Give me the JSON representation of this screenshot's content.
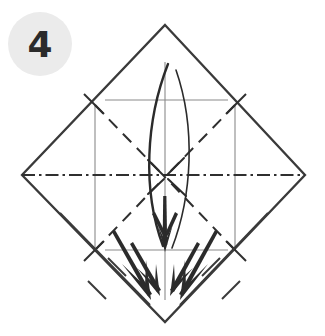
{
  "figure": {
    "kind": "origami-fold-instruction",
    "title": "",
    "step_number": "4",
    "background_color": "#ffffff"
  },
  "step_badge": {
    "label": "4",
    "circle_fill": "#ebebeb",
    "text_color": "#2b2b2b",
    "center_x": 40,
    "center_y": 44,
    "radius": 32
  },
  "colors": {
    "outline": "#3a3a3a",
    "crease_light": "#8a8a8a",
    "crease_dark": "#2f2f2f",
    "arrow": "#2b2b2b",
    "badge_fill": "#ebebeb"
  },
  "geometry": {
    "top_vertex": [
      165,
      25
    ],
    "right_vertex": [
      305,
      175
    ],
    "bottom_vertex": [
      165,
      322
    ],
    "left_vertex": [
      22,
      175
    ],
    "center": [
      165,
      177
    ]
  },
  "legend": {
    "outline_label": "paper edge",
    "valley_label": "valley fold (dashed)",
    "axis_label": "axis of symmetry (dash-dot)",
    "arrow_label": "fold direction arrow"
  }
}
